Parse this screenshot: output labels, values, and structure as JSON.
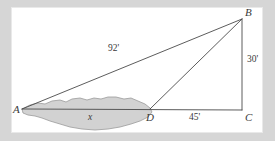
{
  "figure": {
    "type": "geometry-diagram",
    "canvas": {
      "width": 275,
      "height": 141
    },
    "paper": {
      "x": 12,
      "y": 8,
      "width": 250,
      "height": 124,
      "color": "#ffffff"
    },
    "background_color": "#d6d6d6",
    "stroke_color": "#4a4a4a",
    "pond_fill": "#d2d2d2",
    "pond_stroke": "#8f8f8f"
  },
  "vertices": [
    {
      "id": "A",
      "label": "A",
      "x": 22,
      "y": 109,
      "label_x": 13,
      "label_y": 104
    },
    {
      "id": "B",
      "label": "B",
      "x": 242,
      "y": 19,
      "label_x": 245,
      "label_y": 7
    },
    {
      "id": "C",
      "label": "C",
      "x": 242,
      "y": 110,
      "label_x": 245,
      "label_y": 112
    },
    {
      "id": "D",
      "label": "D",
      "x": 150,
      "y": 109,
      "label_x": 146,
      "label_y": 112
    }
  ],
  "edges": [
    {
      "id": "AB",
      "from": "A",
      "to": "B",
      "name": "segment-ab"
    },
    {
      "id": "AC",
      "from": "A",
      "to": "C",
      "name": "segment-ac"
    },
    {
      "id": "BC",
      "from": "B",
      "to": "C",
      "name": "segment-bc"
    },
    {
      "id": "DB",
      "from": "D",
      "to": "B",
      "name": "segment-db"
    }
  ],
  "measurements": [
    {
      "id": "ab",
      "text": "92'",
      "x": 108,
      "y": 44,
      "italic": false,
      "edge": "AB"
    },
    {
      "id": "bc",
      "text": "30'",
      "x": 247,
      "y": 55,
      "italic": false,
      "edge": "BC"
    },
    {
      "id": "dc",
      "text": "45'",
      "x": 189,
      "y": 113,
      "italic": false,
      "edge": "DC"
    },
    {
      "id": "ad",
      "text": "x",
      "x": 88,
      "y": 113,
      "italic": true,
      "edge": "AD"
    }
  ],
  "pond": {
    "name": "pond-region",
    "fill": "#d2d2d2",
    "stroke": "#9a9a9a",
    "path": "M 22,109 L 30,105 L 38,103 L 45,104 L 52,101 L 60,100 L 66,102 L 72,99 L 80,98 L 87,100 L 94,98 L 101,99 L 108,97 L 116,97 L 124,99 L 131,98 L 138,101 L 145,104 L 150,108 L 152,112 L 148,117 L 140,121 L 131,124 L 120,127 L 108,129 L 95,130 L 82,129 L 70,127 L 60,124 L 50,121 L 42,118 L 35,116 L 28,115 L 23,113 Z"
  }
}
